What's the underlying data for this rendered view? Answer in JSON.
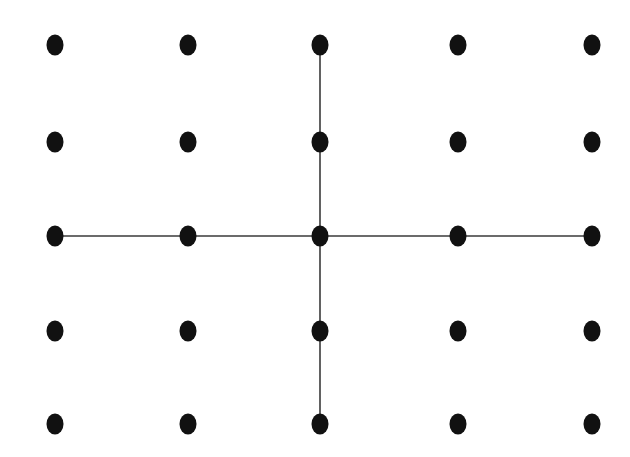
{
  "figure": {
    "canvas": {
      "width": 630,
      "height": 457,
      "background_color": "#ffffff"
    },
    "style": {
      "node_color": "#111111",
      "node_radius_x": 8.5,
      "node_radius_y": 10.5,
      "line_color": "#3a3a3a",
      "line_width": 1.6
    },
    "grid": {
      "rows": 5,
      "columns": 5,
      "column_x": [
        55,
        188,
        320,
        458,
        592
      ],
      "row_y": [
        45,
        142,
        236,
        331,
        424
      ]
    },
    "nodes": [
      {
        "id": "r1c1",
        "row": 1,
        "col": 1,
        "x": 55,
        "y": 45,
        "on_cross": false
      },
      {
        "id": "r1c2",
        "row": 1,
        "col": 2,
        "x": 188,
        "y": 45,
        "on_cross": false
      },
      {
        "id": "r1c3",
        "row": 1,
        "col": 3,
        "x": 320,
        "y": 45,
        "on_cross": true
      },
      {
        "id": "r1c4",
        "row": 1,
        "col": 4,
        "x": 458,
        "y": 45,
        "on_cross": false
      },
      {
        "id": "r1c5",
        "row": 1,
        "col": 5,
        "x": 592,
        "y": 45,
        "on_cross": false
      },
      {
        "id": "r2c1",
        "row": 2,
        "col": 1,
        "x": 55,
        "y": 142,
        "on_cross": false
      },
      {
        "id": "r2c2",
        "row": 2,
        "col": 2,
        "x": 188,
        "y": 142,
        "on_cross": false
      },
      {
        "id": "r2c3",
        "row": 2,
        "col": 3,
        "x": 320,
        "y": 142,
        "on_cross": true
      },
      {
        "id": "r2c4",
        "row": 2,
        "col": 4,
        "x": 458,
        "y": 142,
        "on_cross": false
      },
      {
        "id": "r2c5",
        "row": 2,
        "col": 5,
        "x": 592,
        "y": 142,
        "on_cross": false
      },
      {
        "id": "r3c1",
        "row": 3,
        "col": 1,
        "x": 55,
        "y": 236,
        "on_cross": true
      },
      {
        "id": "r3c2",
        "row": 3,
        "col": 2,
        "x": 188,
        "y": 236,
        "on_cross": true
      },
      {
        "id": "r3c3",
        "row": 3,
        "col": 3,
        "x": 320,
        "y": 236,
        "on_cross": true
      },
      {
        "id": "r3c4",
        "row": 3,
        "col": 4,
        "x": 458,
        "y": 236,
        "on_cross": true
      },
      {
        "id": "r3c5",
        "row": 3,
        "col": 5,
        "x": 592,
        "y": 236,
        "on_cross": true
      },
      {
        "id": "r4c1",
        "row": 4,
        "col": 1,
        "x": 55,
        "y": 331,
        "on_cross": false
      },
      {
        "id": "r4c2",
        "row": 4,
        "col": 2,
        "x": 188,
        "y": 331,
        "on_cross": false
      },
      {
        "id": "r4c3",
        "row": 4,
        "col": 3,
        "x": 320,
        "y": 331,
        "on_cross": true
      },
      {
        "id": "r4c4",
        "row": 4,
        "col": 4,
        "x": 458,
        "y": 331,
        "on_cross": false
      },
      {
        "id": "r4c5",
        "row": 4,
        "col": 5,
        "x": 592,
        "y": 331,
        "on_cross": false
      },
      {
        "id": "r5c1",
        "row": 5,
        "col": 1,
        "x": 55,
        "y": 424,
        "on_cross": false
      },
      {
        "id": "r5c2",
        "row": 5,
        "col": 2,
        "x": 188,
        "y": 424,
        "on_cross": false
      },
      {
        "id": "r5c3",
        "row": 5,
        "col": 3,
        "x": 320,
        "y": 424,
        "on_cross": true
      },
      {
        "id": "r5c4",
        "row": 5,
        "col": 4,
        "x": 458,
        "y": 424,
        "on_cross": false
      },
      {
        "id": "r5c5",
        "row": 5,
        "col": 5,
        "x": 592,
        "y": 424,
        "on_cross": false
      }
    ],
    "edges": [
      {
        "id": "h-row3",
        "orientation": "horizontal",
        "x1": 55,
        "y1": 236,
        "x2": 592,
        "y2": 236
      },
      {
        "id": "v-col3",
        "orientation": "vertical",
        "x1": 320,
        "y1": 45,
        "x2": 320,
        "y2": 424
      }
    ],
    "labels": []
  }
}
